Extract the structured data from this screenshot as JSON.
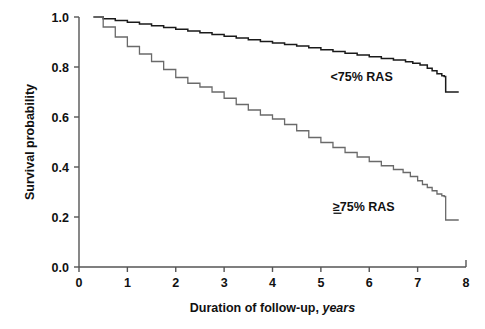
{
  "chart_data": {
    "type": "line",
    "title": "",
    "subtitle": "",
    "xlabel_main": "Duration of follow-up,",
    "xlabel_italic": "years",
    "ylabel": "Survival probability",
    "xlim": [
      0,
      8
    ],
    "ylim": [
      0.0,
      1.0
    ],
    "grid": false,
    "legend_position": "inline-annotations",
    "xticks": [
      "0",
      "1",
      "2",
      "3",
      "4",
      "5",
      "6",
      "7",
      "8"
    ],
    "xtick_values": [
      0,
      1,
      2,
      3,
      4,
      5,
      6,
      7,
      8
    ],
    "yticks": [
      "0.0",
      "0.2",
      "0.4",
      "0.6",
      "0.8",
      "1.0"
    ],
    "ytick_values": [
      0.0,
      0.2,
      0.4,
      0.6,
      0.8,
      1.0
    ],
    "series": [
      {
        "name": "<75% RAS",
        "label": "<75% RAS",
        "color": "#1a1a1a",
        "annotation_x": 5.2,
        "annotation_y": 0.745,
        "x": [
          0.3,
          0.5,
          0.75,
          1.0,
          1.25,
          1.5,
          1.75,
          2.0,
          2.25,
          2.5,
          2.75,
          3.0,
          3.25,
          3.5,
          3.75,
          4.0,
          4.25,
          4.5,
          4.75,
          5.0,
          5.25,
          5.5,
          5.75,
          6.0,
          6.25,
          6.5,
          6.75,
          6.9,
          7.05,
          7.2,
          7.3,
          7.4,
          7.5,
          7.55,
          7.58,
          7.85
        ],
        "y": [
          1.0,
          0.993,
          0.986,
          0.979,
          0.972,
          0.965,
          0.958,
          0.951,
          0.944,
          0.937,
          0.93,
          0.923,
          0.916,
          0.909,
          0.902,
          0.896,
          0.89,
          0.884,
          0.877,
          0.869,
          0.862,
          0.855,
          0.848,
          0.841,
          0.834,
          0.828,
          0.821,
          0.815,
          0.808,
          0.795,
          0.785,
          0.773,
          0.765,
          0.762,
          0.7,
          0.7
        ]
      },
      {
        "name": "≥75% RAS",
        "label": "75% RAS",
        "label_prefix": "≥",
        "color": "#6a6a6a",
        "annotation_x": 5.25,
        "annotation_y": 0.225,
        "x": [
          0.3,
          0.5,
          0.75,
          1.0,
          1.25,
          1.5,
          1.75,
          2.0,
          2.25,
          2.5,
          2.75,
          3.0,
          3.25,
          3.5,
          3.75,
          4.0,
          4.25,
          4.5,
          4.75,
          5.0,
          5.25,
          5.5,
          5.75,
          6.0,
          6.25,
          6.5,
          6.7,
          6.85,
          7.0,
          7.1,
          7.2,
          7.3,
          7.4,
          7.5,
          7.55,
          7.58,
          7.85
        ],
        "y": [
          1.0,
          0.96,
          0.92,
          0.882,
          0.852,
          0.822,
          0.79,
          0.758,
          0.735,
          0.72,
          0.7,
          0.675,
          0.65,
          0.628,
          0.608,
          0.592,
          0.57,
          0.545,
          0.518,
          0.498,
          0.478,
          0.458,
          0.44,
          0.422,
          0.405,
          0.39,
          0.378,
          0.362,
          0.345,
          0.33,
          0.318,
          0.305,
          0.292,
          0.285,
          0.282,
          0.188,
          0.188
        ]
      }
    ]
  }
}
